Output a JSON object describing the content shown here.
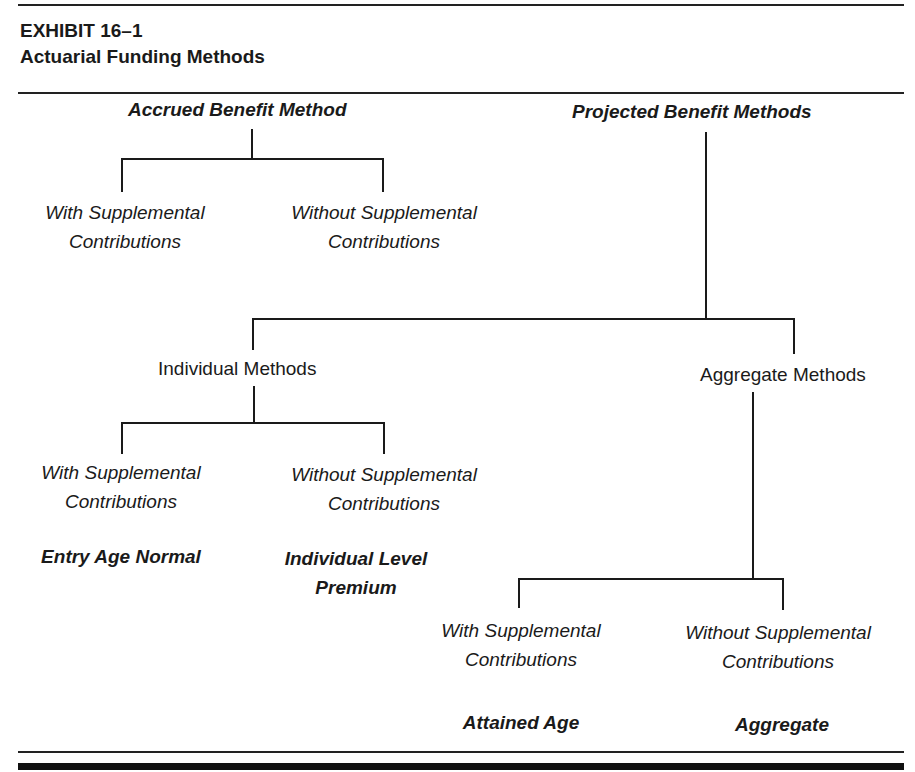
{
  "exhibit": {
    "number": "EXHIBIT 16–1",
    "title": "Actuarial Funding Methods"
  },
  "diagram": {
    "accrued": {
      "label": "Accrued Benefit Method",
      "children": [
        {
          "line1": "With Supplemental",
          "line2": "Contributions"
        },
        {
          "line1": "Without Supplemental",
          "line2": "Contributions"
        }
      ]
    },
    "projected": {
      "label": "Projected Benefit Methods",
      "individual": {
        "label": "Individual Methods",
        "children": [
          {
            "line1": "With Supplemental",
            "line2": "Contributions",
            "method": "Entry Age Normal"
          },
          {
            "line1": "Without Supplemental",
            "line2": "Contributions",
            "method_line1": "Individual Level",
            "method_line2": "Premium"
          }
        ]
      },
      "aggregate": {
        "label": "Aggregate Methods",
        "children": [
          {
            "line1": "With Supplemental",
            "line2": "Contributions",
            "method": "Attained Age"
          },
          {
            "line1": "Without Supplemental",
            "line2": "Contributions",
            "method": "Aggregate"
          }
        ]
      }
    }
  }
}
